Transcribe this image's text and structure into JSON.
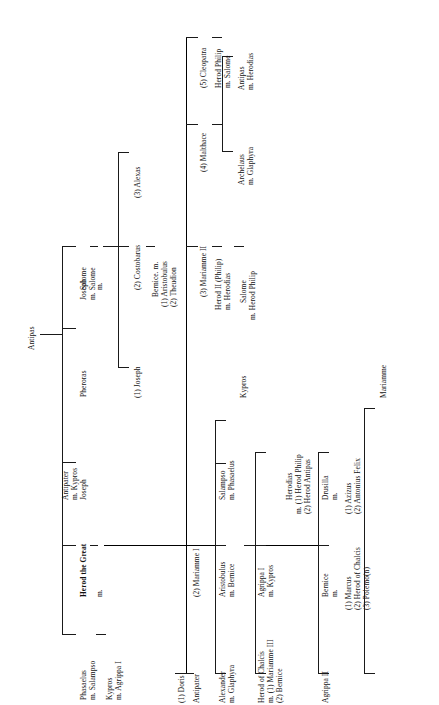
{
  "chart": {
    "orientation": "rotated-90",
    "root": "Antipas"
  },
  "nodes": {
    "antipas_root": "Antipas",
    "antipater_kypros": "Antipater\nm. Kypros",
    "joseph_salome": "Joseph\nm. Salome",
    "joseph_mid": "Joseph",
    "pheroras": "Pheroras",
    "salome": "Salome",
    "herod_the_great": "Herod the Great",
    "phasaelus_salampso": "Phasaelus\nm. Salampso",
    "kypros_agrippa": "Kypros\nm. Agrippa I",
    "salome_m": "m.",
    "joseph_1": "(1) Joseph",
    "costobarus_2": "(2) Costobarus",
    "alexas_3": "(3) Alexas",
    "bernice_m": "Bernice. m.",
    "bernice_m_1": "(1) Aristobulus",
    "bernice_m_2": "(2) Theudion",
    "herod_m": "m.",
    "doris_1": "(1) Doris",
    "antipater": "Antipater",
    "mariamme_I_2": "(2) Mariamme I",
    "mariamme_II_3": "(3) Mariamme II",
    "malthace_4": "(4) Malthace",
    "cleopatra_5": "(5) Cleopatra",
    "alexander_glaphyra": "Alexander\nm. Glaphyra",
    "aristobulus_bernice": "Aristobulus\nm. Bernice",
    "salampso_phasaelus": "Salampso\nm. Phasaelus",
    "kypros": "Kypros",
    "herod_of_chalcis": "Herod of Chalcis",
    "herod_of_chalcis_m1": "m. (1) Mariamme III",
    "herod_of_chalcis_m2": "(2) Bernice",
    "agrippa_I_kypros": "Agrippa I\nm. Kypros",
    "herodias": "Herodias",
    "herodias_m1": "m. (1) Herod Philip",
    "herodias_m2": "(2) Herod Antipas",
    "agrippa_II": "Agrippa II",
    "bernice": "Bernice",
    "bernice_sub_m": "m.",
    "bernice_1": "(1) Marcus",
    "bernice_2": "(2) Herod of Chalcis",
    "bernice_3": "(3) Polemo(n)",
    "drusilla": "Drusilla",
    "drusilla_sub_m": "m.",
    "drusilla_1": "(1) Azizus",
    "drusilla_2": "(2) Antonius Felix",
    "mariamme": "Mariamme",
    "herod_II_philip": "Herod II (Philip)",
    "herod_II_philip_m": "m. Herodias",
    "salome_child": "Salome",
    "salome_child_m": "m. Herod Philip",
    "archelaus": "Archelaus",
    "archelaus_m": "m. Glaphyra",
    "antipas_child": "Antipas",
    "antipas_child_m": "m. Herodias",
    "herod_philip": "Herod Philip",
    "herod_philip_m": "m. Salome"
  },
  "colors": {
    "line": "#1a1a1a",
    "text": "#111111",
    "background": "#ffffff"
  }
}
